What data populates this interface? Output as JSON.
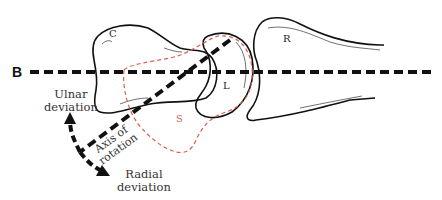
{
  "diagram": {
    "type": "anatomical-wrist-diagram",
    "reference_line": {
      "label": "B",
      "style": "dashed",
      "color": "#111111"
    },
    "bones": [
      {
        "id": "capitate",
        "label": "C",
        "outline": "solid",
        "color": "#111111"
      },
      {
        "id": "lunate",
        "label": "L",
        "outline": "solid",
        "color": "#111111"
      },
      {
        "id": "radius",
        "label": "R",
        "outline": "solid",
        "color": "#111111"
      },
      {
        "id": "scaphoid",
        "label": "S",
        "outline": "dashed",
        "color": "#d9604f"
      }
    ],
    "axis": {
      "label_line1": "Axis of",
      "label_line2": "rotation",
      "style": "dashed"
    },
    "motions": {
      "ulnar": {
        "line1": "Ulnar",
        "line2": "deviation"
      },
      "radial": {
        "line1": "Radial",
        "line2": "deviation"
      }
    }
  }
}
